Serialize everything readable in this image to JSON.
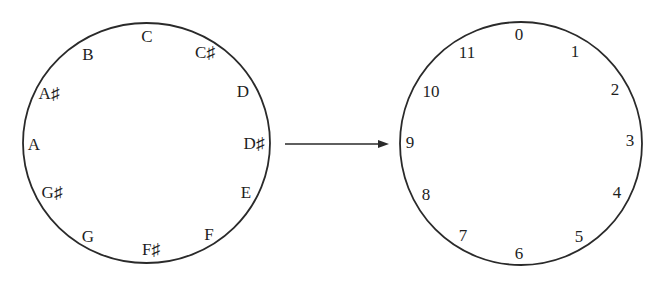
{
  "diagram": {
    "colors": {
      "background": "#ffffff",
      "stroke": "#2a2a2a",
      "text": "#1e1e1e"
    },
    "pitch_circle": {
      "center": [
        146.5,
        143
      ],
      "radius_x": 123.5,
      "radius_y": 120,
      "labels": [
        {
          "text": "C",
          "x": 147,
          "y": 38
        },
        {
          "text": "C♯",
          "x": 205,
          "y": 54
        },
        {
          "text": "D",
          "x": 243,
          "y": 93
        },
        {
          "text": "D♯",
          "x": 254,
          "y": 145
        },
        {
          "text": "E",
          "x": 246,
          "y": 194
        },
        {
          "text": "F",
          "x": 209,
          "y": 236
        },
        {
          "text": "F♯",
          "x": 151,
          "y": 251
        },
        {
          "text": "G",
          "x": 88,
          "y": 238
        },
        {
          "text": "G♯",
          "x": 52,
          "y": 194
        },
        {
          "text": "A",
          "x": 34,
          "y": 146
        },
        {
          "text": "A♯",
          "x": 49,
          "y": 95
        },
        {
          "text": "B",
          "x": 88,
          "y": 56
        }
      ]
    },
    "arrow": {
      "x1": 285,
      "y1": 144,
      "x2": 389,
      "y2": 144
    },
    "integer_circle": {
      "center": [
        521,
        143.5
      ],
      "radius_x": 121,
      "radius_y": 121.5,
      "labels": [
        {
          "text": "0",
          "x": 519,
          "y": 36
        },
        {
          "text": "1",
          "x": 575,
          "y": 53
        },
        {
          "text": "2",
          "x": 615,
          "y": 91
        },
        {
          "text": "3",
          "x": 630,
          "y": 142
        },
        {
          "text": "4",
          "x": 617,
          "y": 194
        },
        {
          "text": "5",
          "x": 579,
          "y": 238
        },
        {
          "text": "6",
          "x": 519,
          "y": 255
        },
        {
          "text": "7",
          "x": 463,
          "y": 237
        },
        {
          "text": "8",
          "x": 426,
          "y": 196
        },
        {
          "text": "9",
          "x": 410,
          "y": 144
        },
        {
          "text": "10",
          "x": 431,
          "y": 93
        },
        {
          "text": "11",
          "x": 467,
          "y": 54
        }
      ]
    }
  }
}
